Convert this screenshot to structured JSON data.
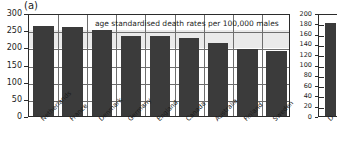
{
  "figure": {
    "panel_a_label": "(a)",
    "panel_b_label": "(b)"
  },
  "chart_data": [
    {
      "type": "bar",
      "panel": "(a)",
      "title": "",
      "annotation": "age standardised death rates per 100,000 males",
      "xlabel": "",
      "ylabel": "",
      "ylim": [
        0,
        300
      ],
      "yticks": [
        0,
        50,
        100,
        150,
        200,
        250,
        300
      ],
      "ytick_labels": [
        "0",
        "50",
        "100",
        "150",
        "200",
        "250",
        "300"
      ],
      "grid": true,
      "legend": "none",
      "bar_color": "#3b3b3b",
      "categories": [
        "Netherlands",
        "France",
        "Denmark",
        "Germany",
        "England",
        "Canada",
        "Australia",
        "Finland",
        "Sweden"
      ],
      "values": [
        263,
        258,
        251,
        234,
        233,
        226,
        214,
        194,
        188
      ]
    },
    {
      "type": "bar",
      "panel": "(b)",
      "title": "",
      "xlabel": "",
      "ylabel": "",
      "ylim": [
        0,
        200
      ],
      "yticks": [
        0,
        20,
        40,
        60,
        80,
        100,
        120,
        140,
        160,
        180,
        200
      ],
      "ytick_labels": [
        "0",
        "20",
        "40",
        "60",
        "80",
        "100",
        "120",
        "140",
        "160",
        "180",
        "200"
      ],
      "grid": true,
      "legend": "none",
      "bar_color": "#3b3b3b",
      "categories": [
        "D"
      ],
      "values": [
        180
      ]
    }
  ]
}
